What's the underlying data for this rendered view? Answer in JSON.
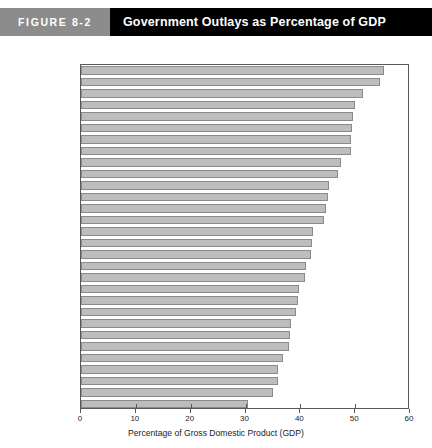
{
  "header": {
    "badge": "FIGURE 8-2",
    "title": "Government Outlays as Percentage of GDP"
  },
  "chart_data": {
    "type": "bar",
    "orientation": "horizontal",
    "title": "Government Outlays as Percentage of GDP",
    "xlabel": "Percentage of Gross Domestic Product (GDP)",
    "ylabel": "",
    "xlim": [
      0,
      60
    ],
    "xticks": [
      0,
      10,
      20,
      30,
      40,
      50,
      60
    ],
    "xtick_labels": [
      "0",
      "10",
      "20",
      "30",
      "40",
      "50",
      "60"
    ],
    "grid": false,
    "legend": null,
    "bar_color": "#bdbdbd",
    "bar_edge_color": "#8a8a8a",
    "axis_color": "#58585a",
    "categories": [
      "Sweden",
      "France",
      "Denmark",
      "Hungary",
      "Austria",
      "Italy",
      "Finland",
      "Belgium",
      "Netherlands",
      "Euro area",
      "United Kingdom",
      "Portugal",
      "Germany",
      "Iceland",
      "Czech Republic",
      "Poland",
      "Norway",
      "New Zealand",
      "Total OECD",
      "Canada",
      "Spain",
      "Luxembourg",
      "United States",
      "Greece",
      "Japan",
      "Slovak Republic",
      "Switzerland",
      "Ireland",
      "Australia",
      "Korea"
    ],
    "values": [
      55.2,
      54.5,
      51.4,
      50.0,
      49.6,
      49.5,
      49.3,
      49.3,
      47.4,
      46.8,
      45.2,
      45.0,
      44.7,
      44.3,
      42.4,
      42.2,
      41.9,
      41.1,
      40.8,
      39.7,
      39.5,
      39.3,
      38.3,
      38.2,
      37.9,
      36.8,
      36.0,
      36.0,
      35.0,
      30.5
    ]
  }
}
